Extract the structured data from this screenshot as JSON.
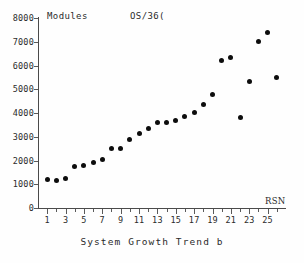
{
  "figure": {
    "width": 304,
    "height": 263,
    "background": "#fefefe",
    "ink_color": "#1a1a1a",
    "marker_color": "#0d0d0d"
  },
  "labels": {
    "y_axis_top": "Modules",
    "series": "OS/36(",
    "x_axis_name": "RSN",
    "caption": "System Growth Trend b"
  },
  "chart_data": {
    "type": "scatter",
    "title": "System Growth Trend b",
    "series_label": "OS/36(",
    "xlabel": "RSN",
    "ylabel": "Modules",
    "xlim": [
      0,
      27
    ],
    "ylim": [
      0,
      8000
    ],
    "ytick_values": [
      0,
      1000,
      2000,
      3000,
      4000,
      5000,
      6000,
      7000,
      8000
    ],
    "ytick_labels": [
      "0",
      "1000",
      "2000",
      "3000",
      "4000",
      "5000",
      "6000",
      "7000",
      "8000"
    ],
    "xtick_values": [
      1,
      2,
      3,
      4,
      5,
      6,
      7,
      8,
      9,
      10,
      11,
      12,
      13,
      14,
      15,
      16,
      17,
      18,
      19,
      20,
      21,
      22,
      23,
      24,
      25,
      26
    ],
    "xtick_labeled": [
      1,
      3,
      5,
      7,
      9,
      11,
      13,
      15,
      17,
      19,
      21,
      23,
      25
    ],
    "xtick_labels": [
      "1",
      "3",
      "5",
      "7",
      "9",
      "11",
      "13",
      "15",
      "17",
      "19",
      "21",
      "23",
      "25"
    ],
    "grid": false,
    "legend": "none",
    "x": [
      1,
      2,
      3,
      4,
      5,
      6,
      7,
      8,
      9,
      10,
      11,
      12,
      13,
      14,
      15,
      16,
      17,
      18,
      19,
      20,
      21,
      22,
      23,
      24,
      25,
      26
    ],
    "values": [
      1180,
      1170,
      1250,
      1730,
      1770,
      1930,
      2050,
      2490,
      2490,
      2880,
      3150,
      3360,
      3600,
      3580,
      3690,
      3860,
      4040,
      4360,
      4790,
      6210,
      6340,
      3810,
      5330,
      7030,
      7390,
      5510
    ]
  }
}
